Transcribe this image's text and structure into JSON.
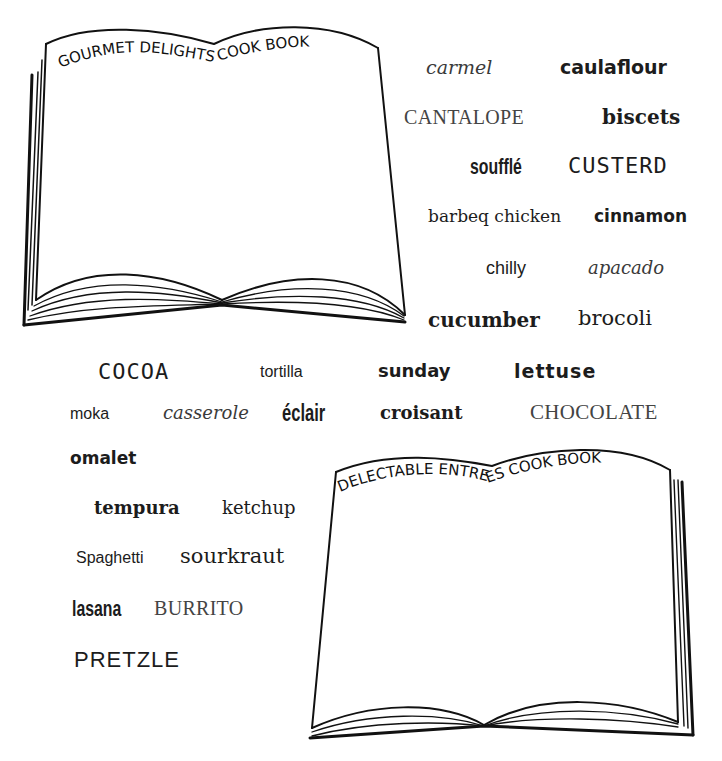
{
  "books": [
    {
      "id": "book-1",
      "title": "GOURMET DELIGHTS COOK BOOK"
    },
    {
      "id": "book-2",
      "title": "DELECTABLE ENTREES COOK BOOK"
    }
  ],
  "words": [
    {
      "text": "carmel"
    },
    {
      "text": "caulaflour"
    },
    {
      "text": "CANTALOPE"
    },
    {
      "text": "biscets"
    },
    {
      "text": "soufflé"
    },
    {
      "text": "CUSTERD"
    },
    {
      "text": "barbeq chicken"
    },
    {
      "text": "cinnamon"
    },
    {
      "text": "chilly"
    },
    {
      "text": "apacado"
    },
    {
      "text": "cucumber"
    },
    {
      "text": "brocoli"
    },
    {
      "text": "COCOA"
    },
    {
      "text": "tortilla"
    },
    {
      "text": "sunday"
    },
    {
      "text": "lettuse"
    },
    {
      "text": "moka"
    },
    {
      "text": "casserole"
    },
    {
      "text": "éclair"
    },
    {
      "text": "croisant"
    },
    {
      "text": "CHOCOLATE"
    },
    {
      "text": "omalet"
    },
    {
      "text": "tempura"
    },
    {
      "text": "ketchup"
    },
    {
      "text": "Spaghetti"
    },
    {
      "text": "sourkraut"
    },
    {
      "text": "lasana"
    },
    {
      "text": "BURRITO"
    },
    {
      "text": "PRETZLE"
    }
  ]
}
